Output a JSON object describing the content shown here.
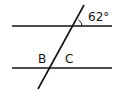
{
  "diagram": {
    "stroke_color": "#111111",
    "background": "#ffffff",
    "angle_label": "62°",
    "label_b": "B",
    "label_c": "C",
    "lines": {
      "top_parallel": {
        "x1": 12,
        "y1": 26,
        "x2": 112,
        "y2": 26
      },
      "bottom_parallel": {
        "x1": 12,
        "y1": 68,
        "x2": 112,
        "y2": 68
      },
      "transversal": {
        "x1": 84,
        "y1": 5,
        "x2": 38,
        "y2": 89
      }
    }
  }
}
